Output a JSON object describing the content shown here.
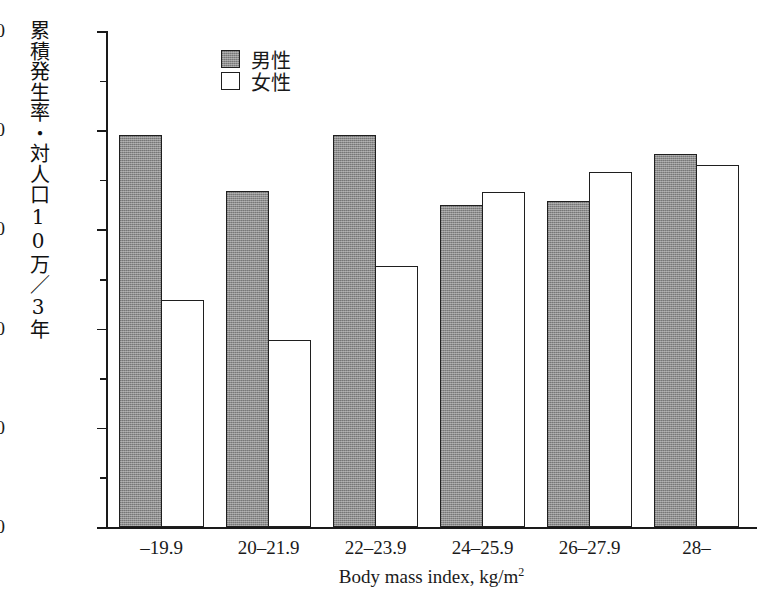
{
  "chart_data": {
    "type": "bar",
    "title": "",
    "xlabel": "Body mass index, kg/m2",
    "xlabel_base": "Body mass index, kg/m",
    "xlabel_sup": "2",
    "ylabel": "累積発生率・対人口10万／3年",
    "categories": [
      "–19.9",
      "20–21.9",
      "22–23.9",
      "24–25.9",
      "26–27.9",
      "28–"
    ],
    "series": [
      {
        "name": "男性",
        "style": "gray-filled",
        "values": [
          790,
          678,
          790,
          649,
          657,
          753
        ]
      },
      {
        "name": "女性",
        "style": "white-open",
        "values": [
          458,
          378,
          527,
          676,
          715,
          729
        ]
      }
    ],
    "ylim": [
      0,
      1000
    ],
    "ytick_major_step": 200,
    "ytick_minor_step": 100,
    "ytick_labels": [
      "1000",
      "800",
      "600",
      "400",
      "200",
      "0"
    ],
    "ytick_values": [
      1000,
      800,
      600,
      400,
      200,
      0
    ],
    "yminor_values": [
      900,
      700,
      500,
      300,
      100
    ],
    "grid": false,
    "legend_position": "top-left-inside",
    "colors": {
      "male_fill": "#8d8d8d",
      "female_fill": "#ffffff",
      "outline": "#1f1f1f",
      "axis": "#1a1a1a",
      "background": "#ffffff"
    }
  },
  "legend": {
    "entries": [
      {
        "label": "男性"
      },
      {
        "label": "女性"
      }
    ]
  }
}
